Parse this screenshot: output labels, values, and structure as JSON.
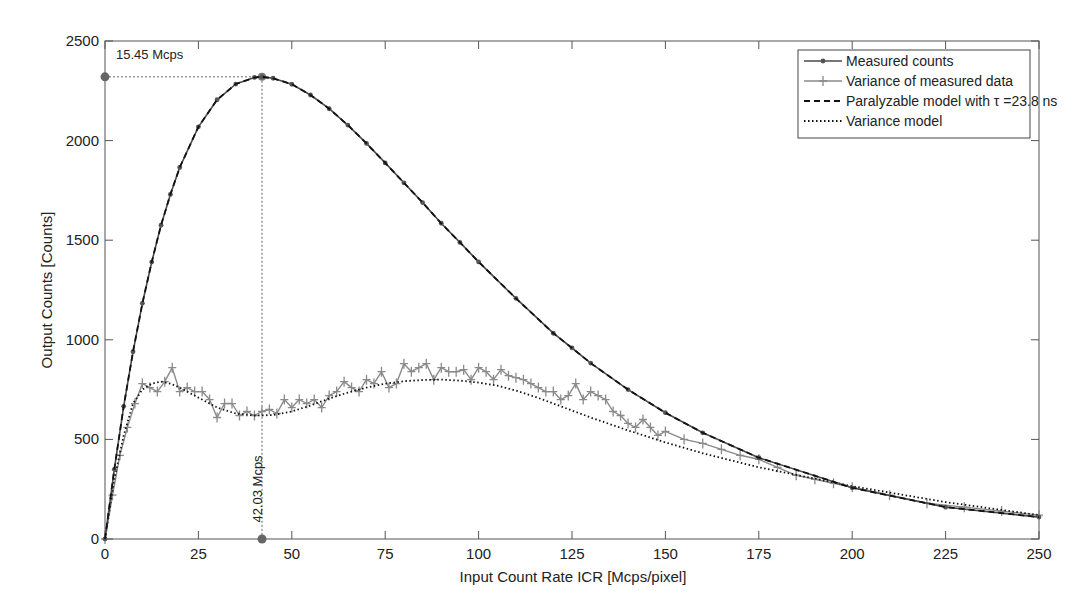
{
  "chart_data": {
    "type": "line",
    "title": "",
    "xlabel": "Input Count Rate ICR [Mcps/pixel]",
    "ylabel": "Output Counts [Counts]",
    "xlim": [
      0,
      250
    ],
    "ylim": [
      0,
      2500
    ],
    "xticks": [
      0,
      25,
      50,
      75,
      100,
      125,
      150,
      175,
      200,
      225,
      250
    ],
    "yticks": [
      0,
      500,
      1000,
      1500,
      2000,
      2500
    ],
    "grid": false,
    "legend_position": "upper right",
    "series": [
      {
        "name": "Measured counts",
        "style": "solid-dot-marker",
        "color": "#555555",
        "x": [
          0,
          2.5,
          5,
          7.5,
          10,
          12.5,
          15,
          17.5,
          20,
          25,
          30,
          35,
          40,
          42.03,
          45,
          50,
          55,
          60,
          65,
          70,
          75,
          80,
          85,
          90,
          95,
          100,
          110,
          120,
          125,
          130,
          140,
          150,
          160,
          175,
          200,
          225,
          250
        ],
        "y": [
          0,
          350,
          666,
          940,
          1183,
          1390,
          1575,
          1730,
          1865,
          2069,
          2205,
          2284,
          2317,
          2320,
          2313,
          2283,
          2229,
          2160,
          2078,
          1986,
          1888,
          1788,
          1689,
          1585,
          1489,
          1391,
          1208,
          1033,
          959,
          883,
          750,
          634,
          533,
          408,
          257,
          160,
          110
        ]
      },
      {
        "name": "Variance of measured data",
        "style": "solid-plus-marker",
        "color": "#8a8a8a",
        "x": [
          0,
          2,
          4,
          6,
          8,
          10,
          12,
          14,
          16,
          18,
          20,
          22,
          24,
          26,
          28,
          30,
          32,
          34,
          36,
          38,
          40,
          42,
          44,
          46,
          48,
          50,
          52,
          54,
          56,
          58,
          60,
          62,
          64,
          66,
          68,
          70,
          72,
          74,
          76,
          78,
          80,
          82,
          84,
          86,
          88,
          90,
          92,
          94,
          96,
          98,
          100,
          102,
          104,
          106,
          108,
          110,
          112,
          114,
          116,
          118,
          120,
          122,
          124,
          126,
          128,
          130,
          132,
          134,
          136,
          138,
          140,
          142,
          144,
          146,
          148,
          150,
          155,
          160,
          165,
          170,
          175,
          180,
          185,
          190,
          195,
          200,
          210,
          220,
          230,
          240,
          250
        ],
        "y": [
          0,
          220,
          420,
          560,
          680,
          780,
          760,
          740,
          790,
          860,
          740,
          760,
          740,
          740,
          700,
          610,
          680,
          680,
          620,
          640,
          620,
          640,
          650,
          630,
          700,
          660,
          700,
          680,
          700,
          660,
          720,
          740,
          790,
          760,
          740,
          800,
          780,
          840,
          760,
          780,
          880,
          840,
          860,
          880,
          800,
          860,
          840,
          840,
          850,
          800,
          860,
          840,
          800,
          850,
          820,
          810,
          800,
          780,
          760,
          740,
          740,
          700,
          720,
          780,
          700,
          740,
          720,
          700,
          640,
          620,
          580,
          560,
          600,
          560,
          520,
          540,
          500,
          480,
          450,
          420,
          400,
          360,
          320,
          300,
          280,
          260,
          220,
          180,
          160,
          140,
          120
        ]
      },
      {
        "name": "Paralyzable model with τ =23.8 ns",
        "style": "dashed",
        "color": "#111111",
        "x": [
          0,
          2.5,
          5,
          7.5,
          10,
          12.5,
          15,
          17.5,
          20,
          25,
          30,
          35,
          40,
          42.03,
          45,
          50,
          55,
          60,
          65,
          70,
          75,
          80,
          85,
          90,
          95,
          100,
          110,
          120,
          125,
          130,
          140,
          150,
          160,
          175,
          200,
          225,
          250
        ],
        "y": [
          0,
          350,
          666,
          940,
          1183,
          1390,
          1575,
          1730,
          1865,
          2069,
          2205,
          2284,
          2317,
          2320,
          2313,
          2283,
          2229,
          2160,
          2078,
          1986,
          1888,
          1788,
          1689,
          1585,
          1489,
          1391,
          1208,
          1033,
          959,
          883,
          750,
          634,
          533,
          408,
          257,
          160,
          110
        ]
      },
      {
        "name": "Variance model",
        "style": "dotted",
        "color": "#111111",
        "x": [
          0,
          2.5,
          5,
          7.5,
          10,
          12.5,
          15,
          17.5,
          20,
          25,
          30,
          35,
          40,
          45,
          50,
          55,
          60,
          65,
          70,
          75,
          80,
          85,
          90,
          95,
          100,
          105,
          110,
          115,
          120,
          125,
          130,
          140,
          150,
          160,
          175,
          200,
          225,
          250
        ],
        "y": [
          0,
          300,
          520,
          680,
          750,
          780,
          790,
          780,
          760,
          710,
          660,
          630,
          620,
          622,
          640,
          670,
          705,
          735,
          760,
          780,
          792,
          798,
          800,
          795,
          785,
          770,
          745,
          715,
          680,
          645,
          610,
          545,
          485,
          430,
          360,
          265,
          185,
          120
        ]
      }
    ],
    "annotations": [
      {
        "text": "15.45 Mcps",
        "x": 0,
        "y": 2320,
        "type": "horizontal-dotted-guide",
        "marker": true
      },
      {
        "text": "42.03 Mcps",
        "x": 42.03,
        "y": 0,
        "type": "vertical-dotted-guide",
        "marker": true,
        "rotated": true
      }
    ],
    "peak": {
      "x": 42.03,
      "y": 2320
    }
  }
}
